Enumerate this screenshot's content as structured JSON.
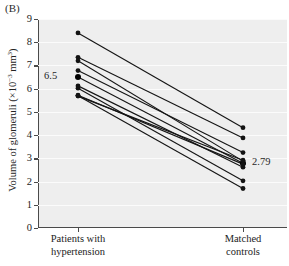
{
  "panel": {
    "label": "(B)"
  },
  "chart_data": {
    "type": "line",
    "title": "",
    "subtitle": "",
    "xlabel": "",
    "ylabel": "Volume of glomeruli (×10⁻³ mm³)",
    "ylabel_base": "Volume of glomeruli (×10",
    "ylabel_exp": "−3",
    "ylabel_tail": " mm",
    "ylabel_tail_exp": "3",
    "ylabel_close": ")",
    "categories": [
      "Patients with hypertension",
      "Matched controls"
    ],
    "category_lines": [
      [
        "Patients with",
        "hypertension"
      ],
      [
        "Matched",
        "controls"
      ]
    ],
    "ylim": [
      0,
      9
    ],
    "yticks": [
      0,
      1,
      2,
      3,
      4,
      5,
      6,
      7,
      8,
      9
    ],
    "ytick_labels": [
      "0",
      "1",
      "2",
      "3",
      "4",
      "5",
      "6",
      "7",
      "8",
      "9"
    ],
    "grid": true,
    "legend": "none",
    "paired": true,
    "n_pairs": 10,
    "series": [
      {
        "name": "pair-1",
        "values": [
          8.4,
          4.32
        ]
      },
      {
        "name": "pair-2",
        "values": [
          7.35,
          3.88
        ]
      },
      {
        "name": "pair-3",
        "values": [
          7.2,
          2.88
        ]
      },
      {
        "name": "pair-4",
        "values": [
          6.78,
          3.25
        ]
      },
      {
        "name": "pair-5",
        "values": [
          6.5,
          2.79
        ]
      },
      {
        "name": "pair-6",
        "values": [
          6.12,
          2.62
        ]
      },
      {
        "name": "pair-7",
        "values": [
          6.02,
          2.03
        ]
      },
      {
        "name": "pair-8",
        "values": [
          5.72,
          2.75
        ]
      },
      {
        "name": "pair-9",
        "values": [
          5.7,
          1.7
        ]
      },
      {
        "name": "pair-10",
        "values": [
          5.68,
          2.92
        ]
      }
    ],
    "annotations": [
      {
        "name": "mean-hypertension",
        "text": "6.5",
        "value": 6.5,
        "group": "Patients with hypertension"
      },
      {
        "name": "mean-controls",
        "text": "2.79",
        "value": 2.79,
        "group": "Matched controls"
      }
    ]
  }
}
